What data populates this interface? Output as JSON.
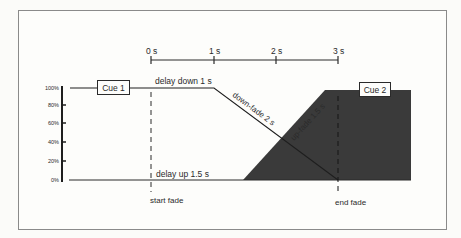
{
  "diagram": {
    "type": "crossfade-timing",
    "time_axis": {
      "ticks": [
        "0 s",
        "1 s",
        "2 s",
        "3 s"
      ]
    },
    "level_axis": {
      "ticks": [
        "100%",
        "80%",
        "60%",
        "40%",
        "20%",
        "0%"
      ]
    },
    "cues": {
      "cue1": "Cue 1",
      "cue2": "Cue 2"
    },
    "annotations": {
      "delay_down": "delay down 1 s",
      "down_fade": "down-fade 2 s",
      "up_fade": "up-fade 1.5 s",
      "delay_up": "delay up 1.5 s",
      "start_fade": "start fade",
      "end_fade": "end fade"
    },
    "colors": {
      "background": "#fbfbf9",
      "frame": "#8a8a8a",
      "line": "#2a2a2a",
      "fill_cue2": "#3a3a3a"
    }
  }
}
